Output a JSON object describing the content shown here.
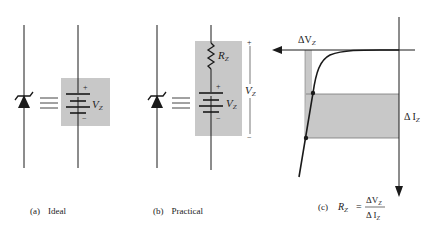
{
  "colors": {
    "shade": "#c8c8c8",
    "line": "#1a1a1a"
  },
  "panel_a": {
    "caption_tag": "(a)",
    "caption": "Ideal",
    "plus": "+",
    "minus": "−",
    "source_label": "V",
    "source_sub": "Z",
    "equiv_icon": "equivalence-icon"
  },
  "panel_b": {
    "caption_tag": "(b)",
    "caption": "Practical",
    "resistor_label": "R",
    "resistor_sub": "Z",
    "plus": "+",
    "minus": "−",
    "source_label": "V",
    "source_sub": "Z",
    "bracket_plus": "+",
    "bracket_minus": "−",
    "bracket_label": "V",
    "bracket_sub": "Z"
  },
  "panel_c": {
    "caption_tag": "(c)",
    "formula_lhs": "R",
    "formula_lhs_sub": "Z",
    "formula_eq": "=",
    "formula_num": "ΔV",
    "formula_num_sub": "Z",
    "formula_den": "Δ I",
    "formula_den_sub": "Z",
    "delta_v_label": "ΔV",
    "delta_v_sub": "Z",
    "delta_i_label": "Δ I",
    "delta_i_sub": "Z"
  }
}
